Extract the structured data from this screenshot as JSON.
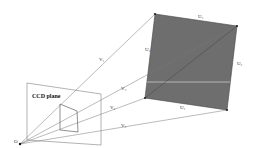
{
  "diagram": {
    "ccd_label": "CCD plane",
    "origin_label": "O",
    "ray_labels": [
      "V₁",
      "V₂",
      "V₃",
      "V₄"
    ],
    "edge_labels": [
      "U₁",
      "U₂",
      "U₃",
      "U₄"
    ],
    "colors": {
      "quad_fill": "#6e6e6e",
      "line": "#555555",
      "highlight_line": "#c8c8c8",
      "background": "#ffffff"
    }
  }
}
